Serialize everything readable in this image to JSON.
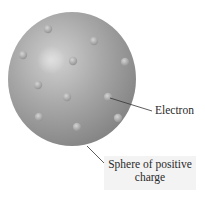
{
  "diagram": {
    "title": "",
    "labels": {
      "electron": "Electron",
      "sphere_line1": "Sphere of positive",
      "sphere_line2": "charge"
    },
    "colors": {
      "sphere_light": "#c9c9c9",
      "sphere_mid": "#a4a4a4",
      "sphere_dark": "#7d7d7d",
      "electron": "#b0b0b0",
      "leader_line": "#333333",
      "label_box": "#f3f3f3"
    },
    "electrons": [
      {
        "x": 48,
        "y": 29
      },
      {
        "x": 94,
        "y": 41
      },
      {
        "x": 23,
        "y": 55
      },
      {
        "x": 73,
        "y": 61
      },
      {
        "x": 125,
        "y": 62
      },
      {
        "x": 38,
        "y": 85
      },
      {
        "x": 67,
        "y": 97
      },
      {
        "x": 108,
        "y": 97
      },
      {
        "x": 39,
        "y": 117
      },
      {
        "x": 77,
        "y": 127
      },
      {
        "x": 118,
        "y": 118
      }
    ]
  }
}
